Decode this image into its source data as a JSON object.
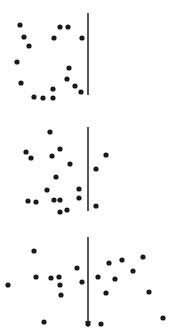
{
  "figure": {
    "width": 180,
    "height": 336,
    "background": "#ffffff",
    "dot_color": "#1a1a1a",
    "line_color": "#2a2a2a",
    "dot_radius": 2.6,
    "panels": [
      {
        "name": "panel-top",
        "line": {
          "x": 88,
          "y1": 13,
          "y2": 95,
          "arrow": false
        },
        "dots": [
          [
            20,
            25
          ],
          [
            24,
            37
          ],
          [
            29,
            46
          ],
          [
            60,
            27
          ],
          [
            68,
            27
          ],
          [
            54,
            38
          ],
          [
            82,
            38
          ],
          [
            17,
            62
          ],
          [
            69,
            68
          ],
          [
            21,
            83
          ],
          [
            67,
            79
          ],
          [
            53,
            89
          ],
          [
            75,
            86
          ],
          [
            81,
            92
          ],
          [
            34,
            97
          ],
          [
            43,
            98
          ],
          [
            53,
            98
          ]
        ]
      },
      {
        "name": "panel-middle",
        "line": {
          "x": 88,
          "y1": 127,
          "y2": 211,
          "arrow": false
        },
        "dots": [
          [
            50,
            132
          ],
          [
            26,
            152
          ],
          [
            31,
            158
          ],
          [
            60,
            149
          ],
          [
            52,
            156
          ],
          [
            70,
            164
          ],
          [
            106,
            155
          ],
          [
            96,
            169
          ],
          [
            56,
            177
          ],
          [
            47,
            190
          ],
          [
            79,
            189
          ],
          [
            28,
            201
          ],
          [
            36,
            202
          ],
          [
            54,
            200
          ],
          [
            60,
            200
          ],
          [
            79,
            198
          ],
          [
            96,
            206
          ],
          [
            60,
            212
          ],
          [
            67,
            210
          ]
        ]
      },
      {
        "name": "panel-bottom",
        "line": {
          "x": 88,
          "y1": 237,
          "y2": 325,
          "arrow": true
        },
        "dots": [
          [
            34,
            251
          ],
          [
            36,
            277
          ],
          [
            51,
            278
          ],
          [
            59,
            277
          ],
          [
            60,
            285
          ],
          [
            61,
            295
          ],
          [
            77,
            268
          ],
          [
            82,
            282
          ],
          [
            98,
            277
          ],
          [
            109,
            263
          ],
          [
            122,
            260
          ],
          [
            115,
            279
          ],
          [
            133,
            271
          ],
          [
            143,
            257
          ],
          [
            8,
            285
          ],
          [
            149,
            292
          ],
          [
            106,
            293
          ],
          [
            44,
            322
          ],
          [
            88,
            324
          ],
          [
            101,
            324
          ],
          [
            163,
            318
          ]
        ]
      }
    ]
  }
}
